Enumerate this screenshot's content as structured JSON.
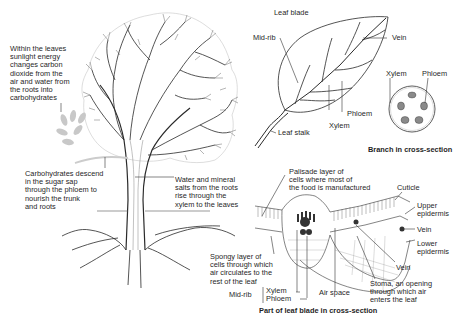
{
  "diagram": {
    "tree": {
      "leaves_note": "Within the leaves\nsunlight energy\nchanges carbon\ndioxide from the\nair and water from\nthe roots into\ncarbohydrates",
      "phloem_note": "Carbohydrates descend\nin the sugar sap\nthrough the phloem to\nnourish the trunk\nand roots",
      "xylem_note": "Water and mineral\nsalts from the roots\nrise through the\nxylem to the leaves"
    },
    "leaf": {
      "leaf_blade": "Leaf blade",
      "mid_rib": "Mid-rib",
      "vein": "Vein",
      "phloem": "Phloem",
      "xylem": "Xylem",
      "leaf_stalk": "Leaf stalk"
    },
    "branch_cross_section": {
      "xylem": "Xylem",
      "phloem": "Phloem",
      "caption": "Branch in cross-section"
    },
    "leaf_cross_section": {
      "palisade": "Palisade layer of\ncells where most of\nthe food is manufactured",
      "cuticle": "Cuticle",
      "upper_epidermis": "Upper\nepidermis",
      "vein_right": "Vein",
      "lower_epidermis": "Lower\nepidermis",
      "vein_bottom": "Vein",
      "stoma": "Stoma, an opening\nthrough which air\nenters the leaf",
      "air_space": "Air space",
      "spongy": "Spongy layer of\ncells through which\nair circulates to the\nrest of the leaf",
      "mid_rib": "Mid-rib",
      "xylem": "Xylem",
      "phloem": "Phloem",
      "caption": "Part of leaf blade in cross-section"
    }
  }
}
